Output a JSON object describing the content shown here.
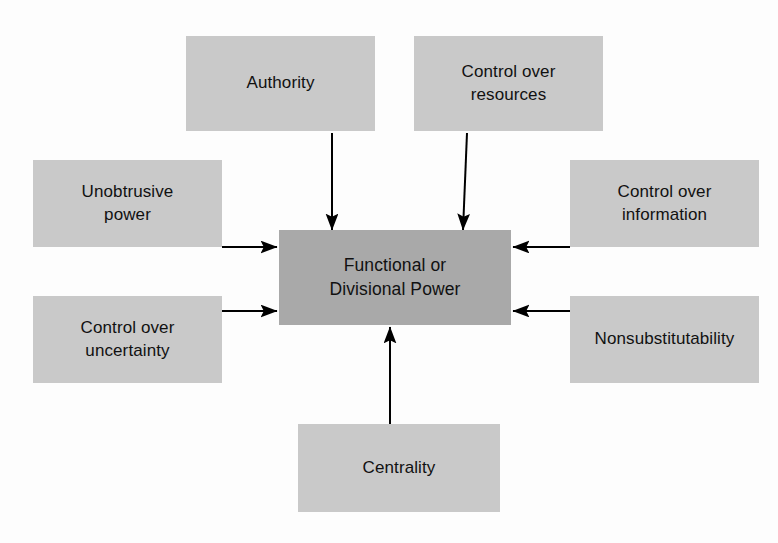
{
  "diagram": {
    "background_color": "#fdfdfd",
    "source_box_color": "#c9c9c9",
    "center_box_color": "#a9a9a9",
    "arrow_color": "#000000",
    "center": {
      "label": "Functional or\nDivisional Power",
      "x": 279,
      "y": 230,
      "width": 232,
      "height": 95
    },
    "sources": [
      {
        "id": "authority",
        "label": "Authority",
        "x": 186,
        "y": 36,
        "width": 189,
        "height": 95,
        "arrow_direction": "down"
      },
      {
        "id": "control-over-resources",
        "label": "Control over\nresources",
        "x": 414,
        "y": 36,
        "width": 189,
        "height": 95,
        "arrow_direction": "down"
      },
      {
        "id": "unobtrusive-power",
        "label": "Unobtrusive\npower",
        "x": 33,
        "y": 160,
        "width": 189,
        "height": 87,
        "arrow_direction": "right"
      },
      {
        "id": "control-over-information",
        "label": "Control over\ninformation",
        "x": 570,
        "y": 160,
        "width": 189,
        "height": 87,
        "arrow_direction": "left"
      },
      {
        "id": "control-over-uncertainty",
        "label": "Control over\nuncertainty",
        "x": 33,
        "y": 296,
        "width": 189,
        "height": 87,
        "arrow_direction": "right"
      },
      {
        "id": "nonsubstitutability",
        "label": "Nonsubstitutability",
        "x": 570,
        "y": 296,
        "width": 189,
        "height": 87,
        "arrow_direction": "left"
      },
      {
        "id": "centrality",
        "label": "Centrality",
        "x": 298,
        "y": 424,
        "width": 202,
        "height": 88,
        "arrow_direction": "up"
      }
    ],
    "arrows": [
      {
        "id": "authority-to-center",
        "from": "authority",
        "to": "center",
        "x1": 332,
        "y1": 133,
        "x2": 332,
        "y2": 230
      },
      {
        "id": "resources-to-center",
        "from": "control-over-resources",
        "to": "center",
        "x1": 467,
        "y1": 133,
        "x2": 463,
        "y2": 230
      },
      {
        "id": "unobtrusive-power-to-center",
        "from": "unobtrusive-power",
        "to": "center",
        "x1": 222,
        "y1": 247,
        "x2": 277,
        "y2": 247
      },
      {
        "id": "control-over-information-to-center",
        "from": "control-over-information",
        "to": "center",
        "x1": 570,
        "y1": 247,
        "x2": 513,
        "y2": 247
      },
      {
        "id": "control-over-uncertainty-to-center",
        "from": "control-over-uncertainty",
        "to": "center",
        "x1": 222,
        "y1": 311,
        "x2": 277,
        "y2": 311
      },
      {
        "id": "nonsubstitutability-to-center",
        "from": "nonsubstitutability",
        "to": "center",
        "x1": 570,
        "y1": 311,
        "x2": 513,
        "y2": 311
      },
      {
        "id": "centrality-to-center",
        "from": "centrality",
        "to": "center",
        "x1": 390,
        "y1": 424,
        "x2": 390,
        "y2": 327
      }
    ]
  }
}
